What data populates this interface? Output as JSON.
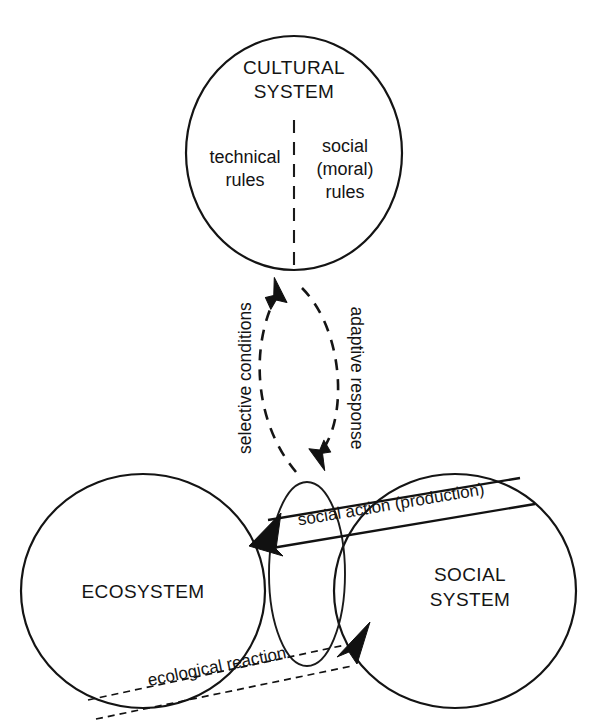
{
  "diagram": {
    "colors": {
      "stroke": "#141414",
      "text": "#141414",
      "background": "#ffffff"
    },
    "cultural_system": {
      "name_line1": "CULTURAL",
      "name_line2": "SYSTEM",
      "left_half_line1": "technical",
      "left_half_line2": "rules",
      "right_half_line1": "social",
      "right_half_line2": "(moral)",
      "right_half_line3": "rules"
    },
    "vertical_arrows": {
      "up_label": "selective conditions",
      "down_label": "adaptive response"
    },
    "ecosystem": {
      "name": "ECOSYSTEM"
    },
    "social_system": {
      "name_line1": "SOCIAL",
      "name_line2": "SYSTEM"
    },
    "horizontal_arrows": {
      "top_label": "social action (production)",
      "bottom_label": "ecological reaction"
    }
  }
}
